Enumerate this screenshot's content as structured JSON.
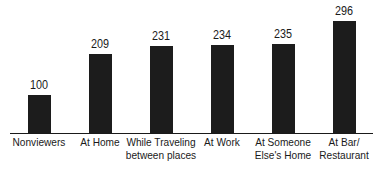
{
  "chart_data": {
    "type": "bar",
    "title": "",
    "xlabel": "",
    "ylabel": "",
    "categories": [
      "Nonviewers",
      "At Home",
      "While Traveling between places",
      "At Work",
      "At Someone Else's Home",
      "At Bar/ Restaurant"
    ],
    "category_lines": [
      [
        "Nonviewers"
      ],
      [
        "At Home"
      ],
      [
        "While Traveling",
        "between places"
      ],
      [
        "At Work"
      ],
      [
        "At Someone",
        "Else's Home"
      ],
      [
        "At Bar/",
        "Restaurant"
      ]
    ],
    "values": [
      100,
      209,
      231,
      234,
      235,
      296
    ],
    "data_labels": [
      "100",
      "209",
      "231",
      "234",
      "235",
      "296"
    ],
    "ylim": [
      0,
      300
    ],
    "grid": false,
    "legend": null,
    "bar_color": "#1c1c1c"
  }
}
